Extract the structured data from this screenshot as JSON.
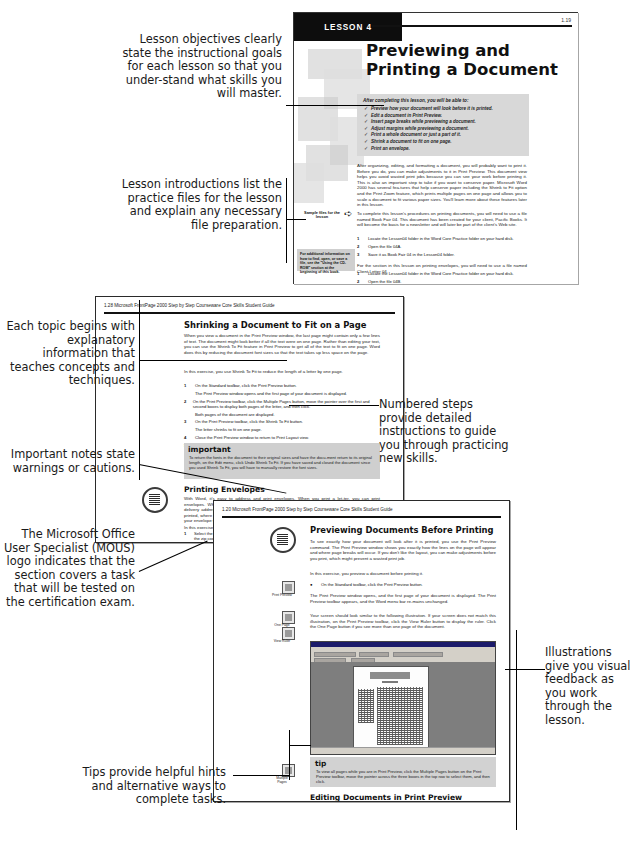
{
  "callouts": {
    "objectives": "Lesson objectives clearly state the instructional goals for each lesson so that you under-stand what skills you will master.",
    "intros": "Lesson introductions list the practice files for the lesson and explain any necessary file preparation.",
    "topics": "Each topic begins with explanatory information that teaches concepts and techniques.",
    "important": "Important notes state warnings or cautions.",
    "mous": "The Microsoft Office User Specialist (MOUS) logo indicates that the section covers a task that will be tested on the certification exam.",
    "tips": "Tips provide helpful hints and alternative ways to complete tasks.",
    "numbered": "Numbered steps provide detailed instructions to guide you through practicing new skills.",
    "illustrations": "Illustrations give you visual feedback as you work through the lesson."
  },
  "page1": {
    "lesson_tab": "LESSON 4",
    "folio": "1.19",
    "title": "Previewing and Printing a Document",
    "objectives_heading": "After completing this lesson, you will be able to:",
    "objectives": [
      "Preview how your document will look before it is printed.",
      "Edit a document in Print Preview.",
      "Insert page breaks while previewing a document.",
      "Adjust margins while previewing a document.",
      "Print a whole document or just a part of it.",
      "Shrink a document to fit on one page.",
      "Print an envelope."
    ],
    "check_glyph": "✓",
    "body1": "After organizing, editing, and formatting a document, you will probably want to print it. Before you do, you can make adjustments to it in Print Preview. This document view helps you avoid wasted print jobs because you can see your work before printing it. This is also an important step to take if you want to conserve paper. Microsoft Word 2000 has several fea-tures that help conserve paper including the Shrink to Fit option and the Print Zoom feature, which prints multiple pages on one page and allows you to scale a document to fit various paper sizes. You'll learn more about these features later in this lesson.",
    "body2": "To complete this lesson's procedures on printing documents, you will need to use a file named Book Fair 04. This document has been created for your client, Pacific Books. It will become the basis for a newsletter and will later be part of the client's Web site.",
    "steps": [
      {
        "n": "1",
        "t": "Locate the Lesson04 folder in the Word Core Practice folder on your hard disk."
      },
      {
        "n": "2",
        "t": "Open the file 04A."
      },
      {
        "n": "3",
        "t": "Save it as Book Fair 04 in the Lesson04 folder."
      }
    ],
    "body3": "For the section in this lesson on printing envelopes, you will need to use a file named Client Letter 04.",
    "steps2": [
      {
        "n": "1",
        "t": "Locate the Lesson04 folder in the Word Core Practice folder on your hard disk."
      },
      {
        "n": "2",
        "t": "Open the file 04B."
      },
      {
        "n": "3",
        "t": "Save it as Client Letter 04 in the Lesson04 folder."
      }
    ],
    "sample_marker": "Sample files for the lesson",
    "arrow_glyph": "➪",
    "note": "For additional information on how to find, open, or save a file, see the \"Using the CD-ROM\" section at the beginning of this book."
  },
  "page2": {
    "folio": "1.28   Microsoft FrontPage 2000 Step by Step Courseware Core Skills Student Guide",
    "heading": "Shrinking a Document to Fit on a Page",
    "body1": "When you view a document in the Print Preview window, the last page might contain only a few lines of text. The document might look better if all the text were on one page. Rather than editing your text, you can use the Shrink To Fit feature in Print Preview to get all of the text to fit on one page. Word does this by reducing the document font sizes so that the text takes up less space on the page.",
    "body2": "In this exercise, you use Shrink To Fit to reduce the length of a letter by one page.",
    "steps": [
      {
        "n": "1",
        "t": "On the Standard toolbar, click the Print Preview button.",
        "s": "The Print Preview window opens and the first page of your document is displayed."
      },
      {
        "n": "2",
        "t": "On the Print Preview toolbar, click the Multiple Pages button, move the pointer over the first and second boxes to display both pages of the letter, and then click.",
        "s": "Both pages of the document are displayed."
      },
      {
        "n": "3",
        "t": "On the Print Preview toolbar, click the Shrink To Fit button.",
        "s": "The letter shrinks to fit on one page."
      },
      {
        "n": "4",
        "t": "Close the Print Preview window to return to Print Layout view.",
        "s": ""
      },
      {
        "n": "5",
        "t": "Scroll through the letter to view the changes.",
        "s": ""
      }
    ],
    "important_title": "important",
    "important_text": "To return the fonts in the document to their original sizes and have the docu-ment return to its original length, on the Edit menu, click Undo Shrink To Fit. If you have saved and closed the document since you used Shrink To Fit, you will have to manually restore the font sizes.",
    "envelopes_heading": "Printing Envelopes",
    "envelopes_body": "With Word, it's easy to address and print envelopes. When you print a let-ter, you can print envelopes. When you print envelopes, a number of options are available. You can specify the delivery address and return address, you can also specify whether or not a postal bar code is printed, where the return address is printed, and the envelope size. Word will even show you what your envelope will look when printed and you can print it directly to your printer.",
    "envelopes_body2": "In this exercise, you print an envelope for a letter.",
    "envelopes_steps": [
      {
        "n": "1",
        "t": "Select the recipient's address at the top of the letter, beginning with Ms. Sanchez and ending with the zip code for DA 04."
      },
      {
        "n": "2",
        "t": "Place an envelope in your printer."
      },
      {
        "n": "3",
        "t": "On the Tools menu, click Envelopes and Labels."
      }
    ],
    "envelopes_tail": "The Envelopes And Labels dialog box appears with the Envelopes tab selected."
  },
  "page3": {
    "folio": "1.20   Microsoft FrontPage 2000 Step by Step Courseware Core Skills Student Guide",
    "heading": "Previewing Documents Before Printing",
    "body1": "To see exactly how your document will look after it is printed, you use the Print Preview command. The Print Preview window shows you exactly how the lines on the page will appear and where page breaks will occur. If you don't like the layout, you can make adjustments before you print, which might prevent a wasted print job.",
    "body2": "In this exercise, you preview a document before printing it.",
    "step1": {
      "n": "●",
      "t": "On the Standard toolbar, click the Print Preview button."
    },
    "body3": "The Print Preview window opens, and the first page of your document is displayed. The Print Preview toolbar appears, and the Word menu bar re-mains unchanged.",
    "body4": "Your screen should look similar to the following illustration. If your screen does not match this illustration, on the Print Preview toolbar, click the View Ruler button to display the ruler. Click the One Page button if you see more than one page of the document.",
    "margin_icons": [
      {
        "label": "Print Preview"
      },
      {
        "label": "One Page"
      },
      {
        "label": "View Ruler"
      }
    ],
    "tip_title": "tip",
    "tip_text": "To view all pages while you are in Print Preview, click the Multiple Pages button on the Print Preview toolbar, move the pointer across the three boxes in the top row to select them, and then click.",
    "tip_icon_label": "Multiple Pages",
    "editing_heading": "Editing Documents in Print Preview",
    "editing_body": "While viewing your document in Print Preview, you might think of new changes you'd like to make. You don't have to switch to Print Layout view or another document view to do this; you can make the changes in the Print Preview window. However, if your text or formatting changes are"
  },
  "colors": {
    "lesson_tab_bg": "#0d0d0d",
    "shade_box": "#d8d8d8",
    "page_border": "#2a2a2a"
  }
}
